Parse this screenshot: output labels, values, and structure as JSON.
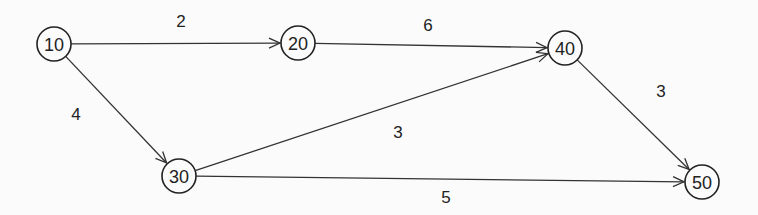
{
  "diagram": {
    "type": "activity-network",
    "nodes": [
      {
        "id": "10",
        "label": "10",
        "x": 54,
        "y": 44
      },
      {
        "id": "20",
        "label": "20",
        "x": 298,
        "y": 43
      },
      {
        "id": "30",
        "label": "30",
        "x": 179,
        "y": 176
      },
      {
        "id": "40",
        "label": "40",
        "x": 565,
        "y": 48
      },
      {
        "id": "50",
        "label": "50",
        "x": 702,
        "y": 182
      }
    ],
    "edges": [
      {
        "from": "10",
        "to": "20",
        "label": "2",
        "lx": 181,
        "ly": 27
      },
      {
        "from": "20",
        "to": "40",
        "label": "6",
        "lx": 428,
        "ly": 31
      },
      {
        "from": "10",
        "to": "30",
        "label": "4",
        "lx": 76,
        "ly": 120
      },
      {
        "from": "30",
        "to": "40",
        "label": "3",
        "lx": 398,
        "ly": 138
      },
      {
        "from": "40",
        "to": "50",
        "label": "3",
        "lx": 661,
        "ly": 97
      },
      {
        "from": "30",
        "to": "50",
        "label": "5",
        "lx": 446,
        "ly": 203
      }
    ]
  }
}
